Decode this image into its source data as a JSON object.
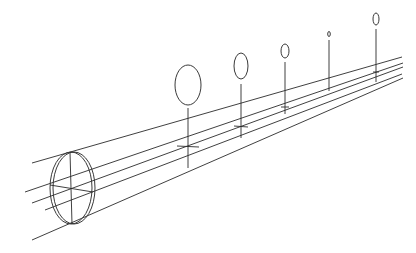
{
  "diagram": {
    "type": "optics-ray-diagram",
    "stroke_color": "#2a2a2a",
    "background": "#ffffff",
    "lens": {
      "cx": 71,
      "cy": 188,
      "rx": 21,
      "ry": 36,
      "rim_offset": 3,
      "axis_vertical": [
        70,
        152,
        72,
        224
      ],
      "axis_horizontal": [
        50,
        185,
        93,
        192
      ]
    },
    "rays": [
      {
        "x1": 32,
        "y1": 163,
        "x2": 402,
        "y2": 57
      },
      {
        "x1": 25,
        "y1": 192,
        "x2": 403,
        "y2": 63
      },
      {
        "x1": 32,
        "y1": 203,
        "x2": 403,
        "y2": 67
      },
      {
        "x1": 45,
        "y1": 210,
        "x2": 402,
        "y2": 74
      },
      {
        "x1": 32,
        "y1": 240,
        "x2": 403,
        "y2": 78
      }
    ],
    "focal_point": {
      "x": 328,
      "y": 94
    },
    "markers": [
      {
        "name": "marker-1",
        "ellipse": {
          "cx": 188,
          "cy": 85,
          "rx": 13,
          "ry": 20
        },
        "stem": [
          188,
          108,
          188,
          168
        ],
        "tick": [
          177,
          146,
          199,
          147
        ]
      },
      {
        "name": "marker-2",
        "ellipse": {
          "cx": 241,
          "cy": 66,
          "rx": 7,
          "ry": 13
        },
        "stem": [
          241,
          84,
          241,
          138
        ],
        "tick": [
          234,
          126,
          248,
          127
        ]
      },
      {
        "name": "marker-3",
        "ellipse": {
          "cx": 285,
          "cy": 51,
          "rx": 4,
          "ry": 7
        },
        "stem": [
          285,
          62,
          285,
          114
        ],
        "tick": [
          281,
          107,
          289,
          107
        ]
      },
      {
        "name": "marker-4",
        "ellipse": {
          "cx": 329,
          "cy": 34,
          "rx": 1.3,
          "ry": 2.5
        },
        "stem": [
          329,
          40,
          329,
          91
        ],
        "tick": null
      },
      {
        "name": "marker-5",
        "ellipse": {
          "cx": 376,
          "cy": 19,
          "rx": 3,
          "ry": 6
        },
        "stem": [
          376,
          29,
          376,
          82
        ],
        "tick": [
          373,
          72,
          379,
          72
        ]
      }
    ]
  }
}
